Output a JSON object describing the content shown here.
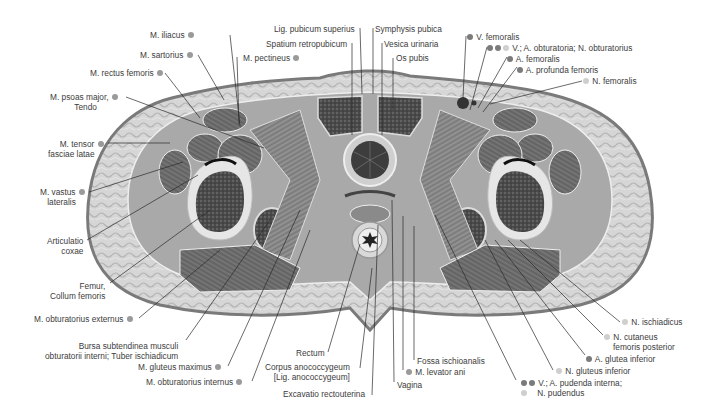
{
  "figure": {
    "colors": {
      "skin": "#8e8e8e",
      "subcutaneous_fat": "#d4d4d4",
      "muscle": "#6f6f6f",
      "bone_marrow": "#3a3a3a",
      "leader_line": "#2a2a2a",
      "dot_vein_artery": "#7b7b7b",
      "dot_muscle": "#9a9a9a",
      "dot_nerve": "#cfcfcf",
      "text": "#3c3c3c"
    }
  },
  "labels_left": [
    {
      "id": "m-iliacus",
      "text": "M. iliacus",
      "dot": "mid"
    },
    {
      "id": "m-sartorius",
      "text": "M. sartorius",
      "dot": "mid"
    },
    {
      "id": "m-rectus-femoris",
      "text": "M. rectus femoris",
      "dot": "mid"
    },
    {
      "id": "m-psoas-major",
      "text": "M. psoas major,",
      "text2": "Tendo",
      "dot": "mid"
    },
    {
      "id": "m-tensor-fasciae-latae",
      "text": "M. tensor",
      "text2": "fasciae latae",
      "dot": "mid"
    },
    {
      "id": "m-vastus-lateralis",
      "text": "M. vastus",
      "text2": "lateralis",
      "dot": "mid"
    },
    {
      "id": "articulatio-coxae",
      "text": "Articulatio",
      "text2": "coxae"
    },
    {
      "id": "femur-collum",
      "text": "Femur,",
      "text2": "Collum femoris"
    },
    {
      "id": "m-obturatorius-externus",
      "text": "M. obturatorius externus",
      "dot": "mid"
    },
    {
      "id": "bursa-subtendinea",
      "text": "Bursa subtendinea musculi",
      "text2": "obturatorii interni; Tuber ischiadicum"
    },
    {
      "id": "m-gluteus-maximus",
      "text": "M. gluteus maximus",
      "dot": "mid"
    },
    {
      "id": "m-obturatorius-internus",
      "text": "M. obturatorius internus",
      "dot": "mid"
    }
  ],
  "labels_top": [
    {
      "id": "m-pectineus",
      "text": "M. pectineus",
      "dot": "mid"
    },
    {
      "id": "lig-pubicum-superius",
      "text": "Lig. pubicum superius"
    },
    {
      "id": "spatium-retropubicum",
      "text": "Spatium retropubicum"
    },
    {
      "id": "symphysis-pubica",
      "text": "Symphysis pubica"
    },
    {
      "id": "vesica-urinaria",
      "text": "Vesica urinaria"
    },
    {
      "id": "os-pubis",
      "text": "Os pubis"
    }
  ],
  "labels_right": [
    {
      "id": "v-femoralis",
      "text": "V. femoralis",
      "dots": [
        "dark"
      ]
    },
    {
      "id": "obturatoria",
      "text": "V.; A. obturatoria; N. obturatorius",
      "dots": [
        "dark",
        "dark",
        "light"
      ]
    },
    {
      "id": "a-femoralis",
      "text": "A. femoralis",
      "dots": [
        "dark"
      ]
    },
    {
      "id": "a-profunda-femoris",
      "text": "A. profunda femoris",
      "dots": [
        "dark"
      ]
    },
    {
      "id": "n-femoralis",
      "text": "N. femoralis",
      "dots": [
        "light"
      ]
    },
    {
      "id": "n-ischiadicus",
      "text": "N. ischiadicus",
      "dots": [
        "light"
      ]
    },
    {
      "id": "n-cutaneus-femoris-posterior",
      "text": "N. cutaneus",
      "text2": "femoris posterior",
      "dots": [
        "light"
      ]
    },
    {
      "id": "a-glutea-inferior",
      "text": "A. glutea inferior",
      "dots": [
        "dark"
      ]
    },
    {
      "id": "n-gluteus-inferior",
      "text": "N. gluteus inferior",
      "dots": [
        "light"
      ]
    },
    {
      "id": "pudenda-interna",
      "text": "V.; A. pudenda interna;",
      "text2": "N. pudendus",
      "dots": [
        "dark",
        "dark"
      ],
      "dots2": [
        "light"
      ]
    }
  ],
  "labels_bottom": [
    {
      "id": "rectum",
      "text": "Rectum"
    },
    {
      "id": "corpus-anococcygeum",
      "text": "Corpus anococcygeum",
      "text2": "[Lig. anococcygeum]"
    },
    {
      "id": "excavatio-rectouterina",
      "text": "Excavatio rectouterina"
    },
    {
      "id": "vagina",
      "text": "Vagina"
    },
    {
      "id": "m-levator-ani",
      "text": "M. levator ani",
      "dot": "mid"
    },
    {
      "id": "fossa-ischioanalis",
      "text": "Fossa ischioanalis"
    }
  ]
}
